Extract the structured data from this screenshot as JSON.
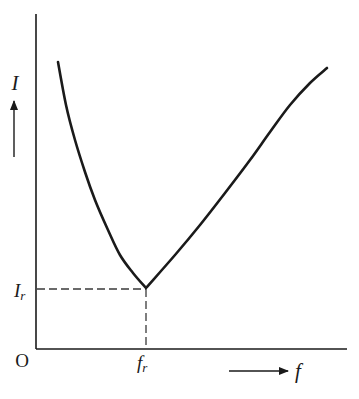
{
  "chart_data": {
    "type": "line",
    "title": "",
    "xlabel": "f",
    "ylabel": "I",
    "origin_label": "O",
    "annotations": {
      "x_marker": {
        "base": "f",
        "sub": "r"
      },
      "y_marker": {
        "base": "I",
        "sub": "r"
      }
    },
    "grid": false,
    "legend": null,
    "series": [
      {
        "name": "I(f)",
        "points_px": [
          [
            58,
            62
          ],
          [
            66,
            105
          ],
          [
            75,
            140
          ],
          [
            85,
            172
          ],
          [
            95,
            200
          ],
          [
            108,
            230
          ],
          [
            120,
            255
          ],
          [
            133,
            273
          ],
          [
            146,
            288
          ],
          [
            175,
            255
          ],
          [
            200,
            225
          ],
          [
            225,
            193
          ],
          [
            250,
            160
          ],
          [
            270,
            132
          ],
          [
            290,
            105
          ],
          [
            310,
            83
          ],
          [
            327,
            68
          ]
        ]
      }
    ],
    "minimum": {
      "x_label": "f_r",
      "y_label": "I_r"
    }
  },
  "labels": {
    "y_axis": "I",
    "x_axis": "f",
    "origin": "O",
    "ir_base": "I",
    "ir_sub": "r",
    "fr_base": "f",
    "fr_sub": "r"
  },
  "colors": {
    "ink": "#1a1a1a",
    "dash": "#3a3a3a",
    "background": "#ffffff"
  }
}
